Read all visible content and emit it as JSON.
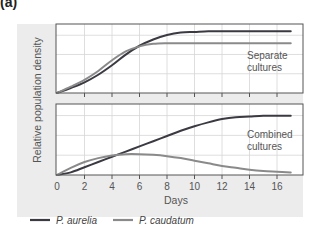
{
  "figure": {
    "panel_label": "(a)"
  },
  "colors": {
    "background_panel": "#ececec",
    "plot_bg": "#ffffff",
    "grid": "#d6d6d6",
    "frame": "#555555",
    "p_aurelia": "#3a3a42",
    "p_caudatum": "#8a8a8a"
  },
  "chart_data": [
    {
      "type": "line",
      "title": "Separate cultures",
      "annotation": [
        "Separate",
        "cultures"
      ],
      "xlabel": "Days",
      "ylabel": "Relative population density",
      "xlim": [
        0,
        18
      ],
      "ylim": [
        0,
        1
      ],
      "grid": true,
      "x": [
        0,
        1,
        2,
        3,
        4,
        5,
        6,
        7,
        8,
        9,
        10,
        11,
        12,
        13,
        14,
        15,
        16,
        17
      ],
      "series": [
        {
          "name": "P. aurelia",
          "values": [
            0.0,
            0.08,
            0.17,
            0.29,
            0.44,
            0.61,
            0.75,
            0.85,
            0.92,
            0.96,
            0.97,
            0.98,
            0.98,
            0.98,
            0.98,
            0.98,
            0.98,
            0.98
          ]
        },
        {
          "name": "P. caudatum",
          "values": [
            0.0,
            0.1,
            0.21,
            0.35,
            0.52,
            0.66,
            0.74,
            0.78,
            0.79,
            0.79,
            0.79,
            0.79,
            0.79,
            0.79,
            0.79,
            0.79,
            0.79,
            0.79
          ]
        }
      ]
    },
    {
      "type": "line",
      "title": "Combined cultures",
      "annotation": [
        "Combined",
        "cultures"
      ],
      "xlabel": "Days",
      "ylabel": "Relative population density",
      "xlim": [
        0,
        18
      ],
      "ylim": [
        0,
        1
      ],
      "grid": true,
      "x": [
        0,
        1,
        2,
        3,
        4,
        5,
        6,
        7,
        8,
        9,
        10,
        11,
        12,
        13,
        14,
        15,
        16,
        17
      ],
      "series": [
        {
          "name": "P. aurelia",
          "values": [
            0.0,
            0.04,
            0.12,
            0.2,
            0.28,
            0.36,
            0.44,
            0.52,
            0.6,
            0.68,
            0.75,
            0.81,
            0.86,
            0.89,
            0.9,
            0.91,
            0.91,
            0.91
          ]
        },
        {
          "name": "P. caudatum",
          "values": [
            0.0,
            0.11,
            0.2,
            0.26,
            0.3,
            0.32,
            0.32,
            0.31,
            0.29,
            0.26,
            0.22,
            0.18,
            0.14,
            0.11,
            0.08,
            0.06,
            0.05,
            0.04
          ]
        }
      ]
    }
  ],
  "axis": {
    "x_ticks": [
      "0",
      "2",
      "4",
      "6",
      "8",
      "10",
      "12",
      "14",
      "16"
    ],
    "x_tick_values": [
      0,
      2,
      4,
      6,
      8,
      10,
      12,
      14,
      16
    ],
    "xlabel": "Days",
    "ylabel": "Relative population density"
  },
  "legend": {
    "items": [
      {
        "label": "P. aurelia",
        "color": "#3a3a42"
      },
      {
        "label": "P. caudatum",
        "color": "#8a8a8a"
      }
    ]
  }
}
